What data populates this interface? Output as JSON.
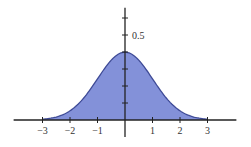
{
  "chart_data": {
    "type": "area",
    "title": "",
    "xlabel": "",
    "ylabel": "",
    "function": "standard_normal_pdf",
    "mean": 0,
    "std": 1,
    "x": [
      -3,
      -2.5,
      -2,
      -1.5,
      -1,
      -0.5,
      0,
      0.5,
      1,
      1.5,
      2,
      2.5,
      3
    ],
    "values": [
      0.0044,
      0.0175,
      0.054,
      0.1295,
      0.242,
      0.3521,
      0.3989,
      0.3521,
      0.242,
      0.1295,
      0.054,
      0.0175,
      0.0044
    ],
    "x_ticks": [
      -3,
      -2,
      -1,
      1,
      2,
      3
    ],
    "x_tick_labels": [
      "−3",
      "−2",
      "−1",
      "1",
      "2",
      "3"
    ],
    "y_ticks": [
      0.1,
      0.2,
      0.3,
      0.4,
      0.5,
      0.6
    ],
    "y_tick_labels": [
      "0.5"
    ],
    "y_labeled_tick": 0.5,
    "xlim": [
      -4.05,
      4.05
    ],
    "ylim": [
      -0.1,
      0.66
    ],
    "fill_range": [
      -3,
      3
    ],
    "grid": false,
    "legend": null,
    "colors": {
      "fill": "#8391d9",
      "outline": "#3e4a96",
      "axis": "#222222"
    }
  }
}
